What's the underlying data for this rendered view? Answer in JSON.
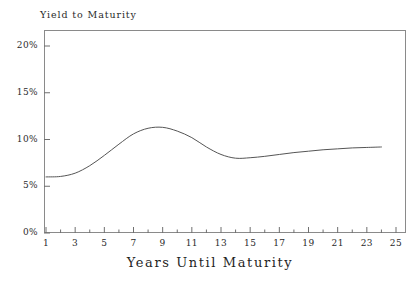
{
  "chart_data": {
    "type": "line",
    "title": "Yield to Maturity",
    "xlabel": "Years Until Maturity",
    "ylabel": "Yield to Maturity",
    "xlim": [
      0,
      26
    ],
    "ylim": [
      0,
      21.8
    ],
    "grid": false,
    "legend": null,
    "x_major_ticks": [
      1,
      3,
      5,
      7,
      9,
      11,
      13,
      15,
      17,
      19,
      21,
      23,
      25
    ],
    "x_minor_ticks": [
      2,
      4,
      6,
      8,
      10,
      12,
      14,
      16,
      18,
      20,
      22,
      24
    ],
    "x_tick_labels": [
      "1",
      "3",
      "5",
      "7",
      "9",
      "11",
      "13",
      "15",
      "17",
      "19",
      "21",
      "23",
      "25"
    ],
    "y_major_ticks": [
      0,
      5,
      10,
      15,
      20
    ],
    "y_tick_labels": [
      "0%",
      "5%",
      "10%",
      "15%",
      "20%"
    ],
    "series": [
      {
        "name": "Yield curve",
        "color": "#555555",
        "x": [
          1,
          2,
          3,
          4,
          5,
          6,
          7,
          8,
          9,
          10,
          11,
          12,
          13,
          14,
          15,
          16,
          17,
          18,
          19,
          20,
          21,
          22,
          23,
          24
        ],
        "values": [
          6.0,
          6.05,
          6.4,
          7.2,
          8.3,
          9.5,
          10.6,
          11.2,
          11.3,
          10.9,
          10.2,
          9.2,
          8.4,
          8.0,
          8.05,
          8.2,
          8.4,
          8.6,
          8.75,
          8.9,
          9.0,
          9.1,
          9.15,
          9.2
        ]
      }
    ],
    "annotations": []
  },
  "axes": {
    "frame_color": "#8a8a8a",
    "tick_color": "#6f6f6f",
    "text_color": "#2a2a2a"
  }
}
